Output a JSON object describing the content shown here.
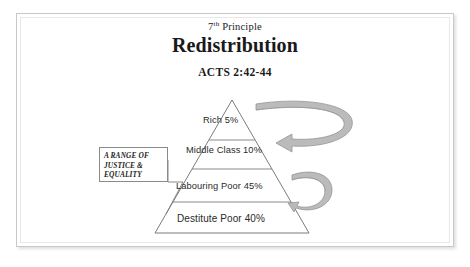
{
  "slide": {
    "heading": {
      "eyebrow_number": "7",
      "eyebrow_ordinal": "th",
      "eyebrow_word": "Principle",
      "title": "Redistribution",
      "scripture_reference": "ACTS 2:42-44"
    },
    "annotation_box": {
      "lines": [
        "A RANGE OF",
        "JUSTICE &",
        "EQUALITY"
      ]
    },
    "pyramid": {
      "tiers": [
        {
          "id": "rich",
          "label": "Rich 5%",
          "percent": "5%",
          "name": "Rich"
        },
        {
          "id": "middle",
          "label": "Middle Class 10%",
          "percent": "10%",
          "name": "Middle Class"
        },
        {
          "id": "labouring",
          "label": "Labouring Poor 45%",
          "percent": "45%",
          "name": "Labouring Poor"
        },
        {
          "id": "destitute",
          "label": "Destitute Poor 40%",
          "percent": "40%",
          "name": "Destitute Poor"
        }
      ]
    },
    "arrows": [
      {
        "id": "upper-redistribution-arrow",
        "direction": "left",
        "description": "curved loop arrow from top tier toward middle class"
      },
      {
        "id": "lower-redistribution-arrow",
        "direction": "left",
        "description": "small curved loop arrow beside labouring poor tier"
      }
    ],
    "colors": {
      "outline": "#7d7d7d",
      "arrow_fill": "#b0b0b0",
      "text": "#2a2a2a",
      "frame_border": "#c9c9c9",
      "background": "#ffffff"
    }
  }
}
